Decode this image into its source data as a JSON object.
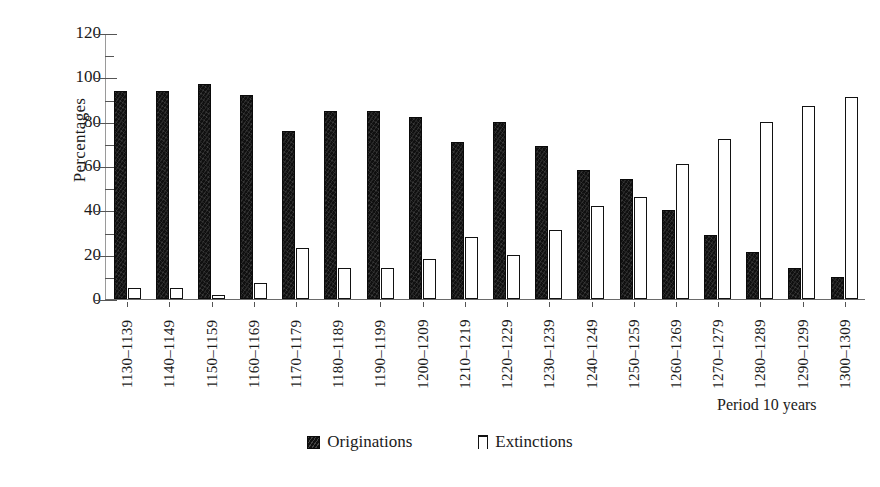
{
  "chart_data": {
    "type": "bar",
    "title": "",
    "xlabel": "Period 10 years",
    "ylabel": "Percentages",
    "ylim": [
      0,
      120
    ],
    "yticks": [
      0,
      20,
      40,
      60,
      80,
      100,
      120
    ],
    "grid": false,
    "legend_position": "bottom",
    "categories": [
      "1130–1139",
      "1140–1149",
      "1150–1159",
      "1160–1169",
      "1170–1179",
      "1180–1189",
      "1190–1199",
      "1200–1209",
      "1210–1219",
      "1220–1229",
      "1230–1239",
      "1240–1249",
      "1250–1259",
      "1260–1269",
      "1270–1279",
      "1280–1289",
      "1290–1299",
      "1300–1309"
    ],
    "series": [
      {
        "name": "Originations",
        "fill": "#101010",
        "values": [
          94,
          94,
          97,
          92,
          76,
          85,
          85,
          82,
          71,
          80,
          69,
          58,
          54,
          40,
          29,
          21,
          14,
          10
        ]
      },
      {
        "name": "Extinctions",
        "fill": "#ffffff",
        "values": [
          5,
          5,
          2,
          7,
          23,
          14,
          14,
          18,
          28,
          20,
          31,
          42,
          46,
          61,
          72,
          80,
          87,
          91
        ]
      }
    ]
  },
  "legend": {
    "items": [
      {
        "label": "Originations",
        "swatch": "filled-square-swatch"
      },
      {
        "label": "Extinctions",
        "swatch": "outlined-square-swatch"
      }
    ]
  }
}
